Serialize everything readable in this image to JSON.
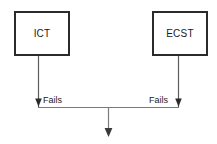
{
  "diagram": {
    "title": "",
    "background_color": "#ffffff",
    "line_color": "#5a5a5a",
    "box_border_color": "#2b2b2b",
    "text_color": "#1a1a1a",
    "nodes": [
      {
        "id": "ict",
        "label": "ICT",
        "shape": "rectangle"
      },
      {
        "id": "ecst",
        "label": "ECST",
        "shape": "rectangle"
      }
    ],
    "edges": [
      {
        "id": "ict-fails",
        "from": "ict",
        "label": "Fails",
        "arrow": "down"
      },
      {
        "id": "ecst-fails",
        "from": "ecst",
        "label": "Fails",
        "arrow": "down"
      },
      {
        "id": "merge-out",
        "from": "junction",
        "label": "",
        "arrow": "down"
      }
    ]
  }
}
